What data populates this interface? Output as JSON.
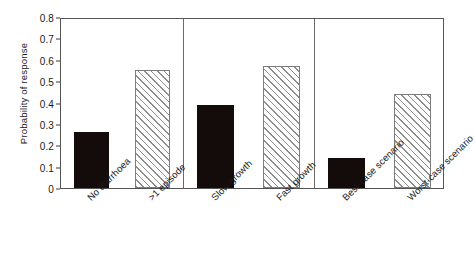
{
  "chart_data": {
    "type": "bar",
    "title": "",
    "subtitle": "",
    "xlabel": "",
    "ylabel": "Probability of response",
    "ylim": [
      0,
      0.8
    ],
    "yticks": [
      "0",
      "0.1",
      "0.2",
      "0.3",
      "0.4",
      "0.5",
      "0.6",
      "0.7",
      "0.8"
    ],
    "ytick_values": [
      0,
      0.1,
      0.2,
      0.3,
      0.4,
      0.5,
      0.6,
      0.7,
      0.8
    ],
    "grid": false,
    "legend": null,
    "legend_position": "none",
    "panels": [
      {
        "name": "diarrhoea",
        "categories": [
          "No diarrhoea",
          ">1 episode"
        ]
      },
      {
        "name": "growth",
        "categories": [
          "Slow growth",
          "Fast growth"
        ]
      },
      {
        "name": "scenario",
        "categories": [
          "Best-case scenario",
          "Worst-case scenario"
        ]
      }
    ],
    "categories": [
      "No diarrhoea",
      ">1 episode",
      "Slow growth",
      "Fast growth",
      "Best-case scenario",
      "Worst-case scenario"
    ],
    "values": [
      0.26,
      0.55,
      0.39,
      0.57,
      0.14,
      0.44
    ],
    "bar_styles": [
      "solid",
      "hatch",
      "solid",
      "hatch",
      "solid",
      "hatch"
    ],
    "colors": {
      "solid_fill": "#140b0b",
      "hatch_line": "#8d8d8d",
      "hatch_bg": "#ffffff",
      "axis": "#555555",
      "text": "#1a1a1a"
    }
  }
}
